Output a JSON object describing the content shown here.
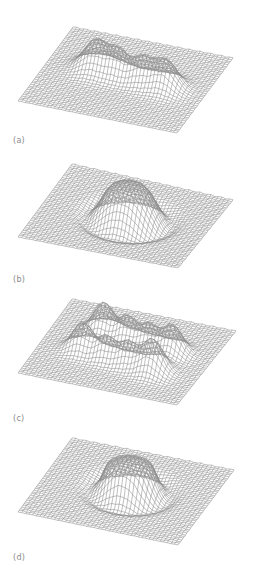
{
  "figure": {
    "panels": [
      {
        "id": "a",
        "label": "(a)",
        "label_y": 136,
        "corners": {
          "back_left": [
            73,
            27
          ],
          "back_right": [
            233,
            58
          ],
          "front_right": [
            177,
            133
          ],
          "front_left": [
            18,
            101
          ]
        },
        "surface": "four_gaussian_peaks_row",
        "peaks": [
          {
            "u": 0.3,
            "v": 0.45,
            "h": 30,
            "s": 0.075
          },
          {
            "u": 0.45,
            "v": 0.47,
            "h": 24,
            "s": 0.06
          },
          {
            "u": 0.6,
            "v": 0.49,
            "h": 24,
            "s": 0.06
          },
          {
            "u": 0.75,
            "v": 0.5,
            "h": 28,
            "s": 0.07
          }
        ]
      },
      {
        "id": "b",
        "label": "(b)",
        "label_y": 275,
        "corners": {
          "back_left": [
            72,
            164
          ],
          "back_right": [
            233,
            200
          ],
          "front_right": [
            178,
            268
          ],
          "front_left": [
            18,
            237
          ]
        },
        "surface": "broad_dome_with_ridge",
        "peaks": [
          {
            "u": 0.52,
            "v": 0.5,
            "h": 34,
            "s": 0.16,
            "type": "dome"
          }
        ]
      },
      {
        "id": "c",
        "label": "(c)",
        "label_y": 414,
        "corners": {
          "back_left": [
            72,
            299
          ],
          "back_right": [
            236,
            331
          ],
          "front_right": [
            177,
            405
          ],
          "front_left": [
            18,
            373
          ]
        },
        "surface": "eight_gaussian_peaks_two_rows",
        "peaks": [
          {
            "u": 0.3,
            "v": 0.32,
            "h": 30,
            "s": 0.06
          },
          {
            "u": 0.46,
            "v": 0.36,
            "h": 24,
            "s": 0.055
          },
          {
            "u": 0.6,
            "v": 0.38,
            "h": 22,
            "s": 0.055
          },
          {
            "u": 0.75,
            "v": 0.4,
            "h": 28,
            "s": 0.06
          },
          {
            "u": 0.26,
            "v": 0.58,
            "h": 28,
            "s": 0.06
          },
          {
            "u": 0.42,
            "v": 0.62,
            "h": 22,
            "s": 0.055
          },
          {
            "u": 0.56,
            "v": 0.64,
            "h": 22,
            "s": 0.055
          },
          {
            "u": 0.72,
            "v": 0.66,
            "h": 32,
            "s": 0.065
          }
        ]
      },
      {
        "id": "d",
        "label": "(d)",
        "label_y": 553,
        "corners": {
          "back_left": [
            72,
            438
          ],
          "back_right": [
            234,
            470
          ],
          "front_right": [
            178,
            545
          ],
          "front_left": [
            18,
            512
          ]
        },
        "surface": "dome_with_crater_ring",
        "peaks": [
          {
            "u": 0.52,
            "v": 0.48,
            "h": 30,
            "s": 0.15,
            "type": "dome"
          }
        ]
      }
    ],
    "style": {
      "mesh_color": "#8c8c8c",
      "mesh_dark_color": "#6e6e6e",
      "label_color": "#8a8a8a",
      "background": "#ffffff",
      "grid_resolution": 44
    }
  }
}
